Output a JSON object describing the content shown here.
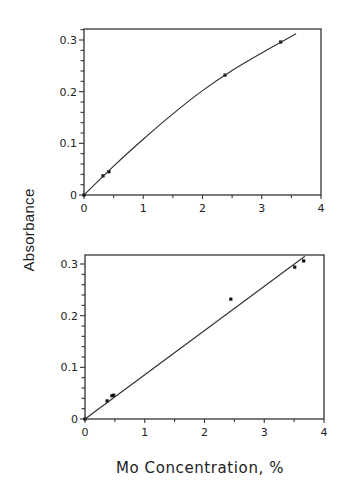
{
  "figure": {
    "ylabel": "Absorbance",
    "xlabel": "Mo Concentration, %"
  },
  "chart_data": [
    {
      "type": "scatter",
      "panel": "top",
      "title": "",
      "xlabel": "Mo Concentration, %",
      "ylabel": "Absorbance",
      "xlim": [
        0,
        4
      ],
      "ylim": [
        0,
        0.32
      ],
      "xticks": [
        0,
        1,
        2,
        3,
        4
      ],
      "yticks": [
        0,
        0.1,
        0.2,
        0.3
      ],
      "ytick_labels": [
        "0",
        "0.1",
        "0.2",
        "0.3"
      ],
      "grid": false,
      "series": [
        {
          "name": "measured",
          "kind": "points",
          "x": [
            0.0,
            0.32,
            0.42,
            2.38,
            3.32
          ],
          "y": [
            0.0,
            0.037,
            0.045,
            0.232,
            0.296
          ]
        },
        {
          "name": "fit",
          "kind": "curve",
          "x": [
            0,
            0.5,
            1.0,
            1.5,
            2.0,
            2.5,
            3.0,
            3.58
          ],
          "y": [
            0,
            0.056,
            0.108,
            0.157,
            0.202,
            0.241,
            0.275,
            0.312
          ]
        }
      ]
    },
    {
      "type": "scatter",
      "panel": "bottom",
      "title": "",
      "xlabel": "Mo Concentration, %",
      "ylabel": "Absorbance",
      "xlim": [
        0,
        4
      ],
      "ylim": [
        0,
        0.32
      ],
      "xticks": [
        0,
        1,
        2,
        3,
        4
      ],
      "yticks": [
        0,
        0.1,
        0.2,
        0.3
      ],
      "ytick_labels": [
        "0",
        "0.1",
        "0.2",
        "0.3"
      ],
      "grid": false,
      "series": [
        {
          "name": "measured",
          "kind": "points",
          "x": [
            0.0,
            0.37,
            0.45,
            0.48,
            2.44,
            3.51,
            3.66
          ],
          "y": [
            0.0,
            0.035,
            0.045,
            0.046,
            0.232,
            0.294,
            0.306
          ]
        },
        {
          "name": "linear fit",
          "kind": "line",
          "x": [
            0,
            3.68
          ],
          "y": [
            0,
            0.315
          ]
        }
      ]
    }
  ]
}
